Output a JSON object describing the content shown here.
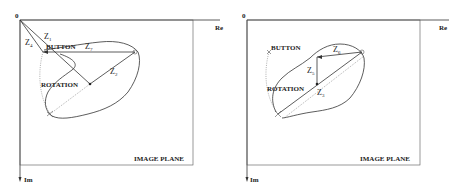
{
  "panels": [
    {
      "id": "left",
      "origin_label": "0",
      "axis_real": "Re",
      "axis_imag": "Im",
      "plane_label": "IMAGE PLANE",
      "button_label": "BUTTON",
      "rotation_label": "ROTATION",
      "vectors": [
        {
          "name": "Z",
          "sub": "1"
        },
        {
          "name": "Z",
          "sub": "4"
        },
        {
          "name": "Z",
          "sub": "7"
        },
        {
          "name": "Z",
          "sub": "2"
        }
      ]
    },
    {
      "id": "right",
      "origin_label": "0",
      "axis_real": "Re",
      "axis_imag": "Im",
      "plane_label": "IMAGE PLANE",
      "button_label": "BUTTON",
      "rotation_label": "ROTATION",
      "vectors": [
        {
          "name": "Z",
          "sub": "6"
        },
        {
          "name": "Z",
          "sub": "5"
        },
        {
          "name": "Z",
          "sub": "3"
        }
      ]
    }
  ]
}
